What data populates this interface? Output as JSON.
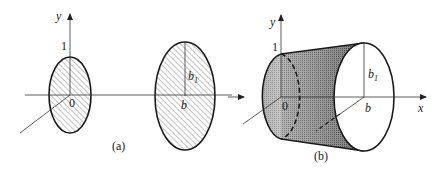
{
  "panel_a": {
    "caption": "(a)",
    "y_axis_label": "y",
    "tick_one": "1",
    "origin_label": "0",
    "b1_label": "b",
    "b1_sub": "1",
    "b_label": "b"
  },
  "panel_b": {
    "caption": "(b)",
    "y_axis_label": "y",
    "tick_one": "1",
    "origin_label": "0",
    "b1_label": "b",
    "b1_sub": "1",
    "b_label": "b",
    "x_axis_label": "x"
  },
  "colors": {
    "stroke": "#1a1a1a",
    "hatch": "#555555",
    "shade_dark": "#3a3a3a",
    "shade_light": "#d8d8d8"
  }
}
